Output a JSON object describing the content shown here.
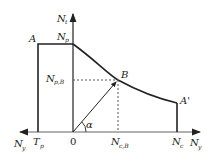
{
  "diagram": {
    "type": "interaction-diagram",
    "colors": {
      "line": "#222222",
      "dashed": "#555555",
      "background": "#ffffff"
    },
    "axes": {
      "vertical": {
        "label": "N",
        "sub": "t"
      },
      "horizontal_right": {
        "label": "N",
        "sub": "y"
      },
      "horizontal_left": {
        "label": "N",
        "sub": "y"
      }
    },
    "points": {
      "A": {
        "label": "A"
      },
      "A_prime": {
        "label": "A'"
      },
      "B": {
        "label": "B"
      },
      "origin": {
        "label": "0"
      }
    },
    "tick_labels": {
      "Np": {
        "label": "N",
        "sub": "p"
      },
      "NpB": {
        "label": "N",
        "sub": "p,B"
      },
      "NcB": {
        "label": "N",
        "sub": "c,B"
      },
      "Nc": {
        "label": "N",
        "sub": "c"
      },
      "Tp": {
        "label": "T",
        "sub": "p"
      }
    },
    "angle": {
      "label": "α"
    }
  }
}
